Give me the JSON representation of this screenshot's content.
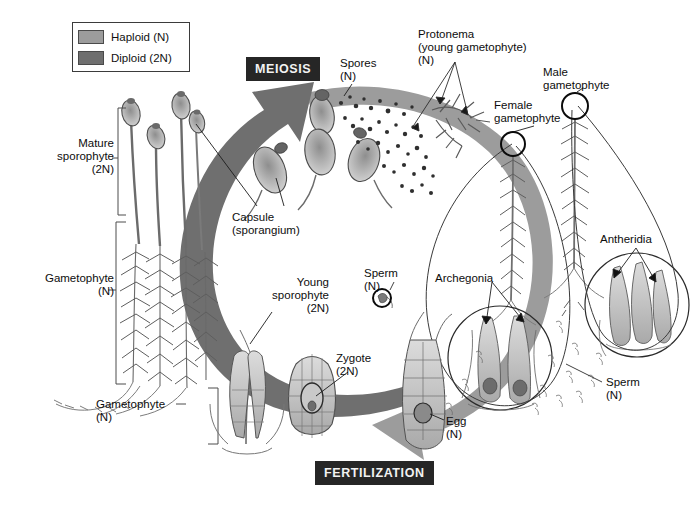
{
  "legend": {
    "name": "ploidy-legend",
    "items": [
      {
        "label": "Haploid (N)",
        "color": "#9c9c9c"
      },
      {
        "label": "Diploid (2N)",
        "color": "#6f6f6f"
      }
    ]
  },
  "banners": [
    {
      "key": "meiosis",
      "label": "MEIOSIS"
    },
    {
      "key": "fertilization",
      "label": "FERTILIZATION"
    }
  ],
  "labels": {
    "mature_sporophyte": "Mature\nsporophyte\n(2N)",
    "gametophyte_left": "Gametophyte\n(N)",
    "gametophyte_bottom": "Gametophyte\n(N)",
    "capsule": "Capsule\n(sporangium)",
    "young_sporophyte": "Young\nsporophyte\n(2N)",
    "spores": "Spores\n(N)",
    "protonema": "Protonema\n(young gametophyte)\n(N)",
    "female_gametophyte": "Female\ngametophyte",
    "male_gametophyte": "Male\ngametophyte",
    "antheridia": "Antheridia",
    "archegonia": "Archegonia",
    "sperm_left": "Sperm\n(N)",
    "sperm_right": "Sperm\n(N)",
    "zygote": "Zygote\n(2N)",
    "egg": "Egg\n(N)"
  },
  "colors": {
    "haploid_arrow": "#9c9c9c",
    "diploid_arrow": "#6f6f6f",
    "banner_bg": "#262626",
    "banner_text": "#f2f2f2",
    "outline": "#3b3b3b",
    "illustration_ink": "#5e5e5e",
    "background": "#ffffff"
  },
  "cycle": {
    "type": "life-cycle",
    "haploid_arc_label": "haploid (N) phase arc — spores to gametophytes to gametes",
    "diploid_arc_label": "diploid (2N) phase arc — zygote to sporophyte to meiosis"
  }
}
